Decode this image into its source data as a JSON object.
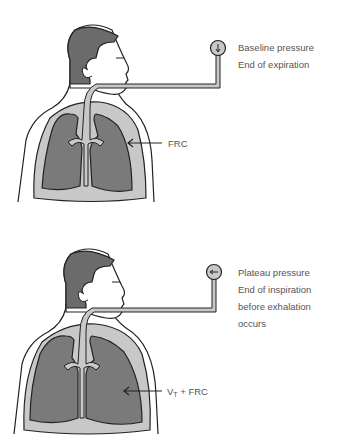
{
  "colors": {
    "hair": "#6b6b6b",
    "lung": "#7a7a7a",
    "airway": "#c8c8c8",
    "outline": "#222222",
    "text": "#555555"
  },
  "panels": [
    {
      "state": "expiration",
      "gauge_icon": "arrow-down",
      "caption": [
        "Baseline pressure",
        "End of expiration"
      ],
      "volume_label": "FRC"
    },
    {
      "state": "inspiration",
      "gauge_icon": "arrow-left",
      "caption": [
        "Plateau pressure",
        "End of inspiration",
        "before exhalation",
        "occurs"
      ],
      "volume_label_main": "V",
      "volume_label_sub": "T",
      "volume_label_rest": " + FRC"
    }
  ]
}
